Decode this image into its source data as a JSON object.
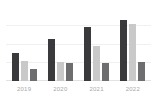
{
  "chart_data": {
    "type": "bar",
    "title": "",
    "subtitle": "",
    "xlabel": "",
    "ylabel": "",
    "categories": [
      "2019",
      "2020",
      "2021",
      "2022"
    ],
    "series": [
      {
        "name": "series-1",
        "color": "#3a3a3c",
        "values": [
          38,
          57,
          74,
          84
        ]
      },
      {
        "name": "series-2",
        "color": "#c9c9c9",
        "values": [
          27,
          26,
          48,
          78
        ]
      },
      {
        "name": "series-3",
        "color": "#6e6e70",
        "values": [
          16,
          25,
          25,
          26
        ]
      }
    ],
    "ylim": [
      0,
      100
    ],
    "grid": true,
    "gridlines": [
      25,
      50,
      75
    ],
    "legend": "none",
    "y_tick_labels": [],
    "axis_label_color": "#a8a8a8",
    "gridline_color": "#f0f0f0",
    "baseline_color": "#e2e2e2",
    "background_color": "#ffffff"
  }
}
